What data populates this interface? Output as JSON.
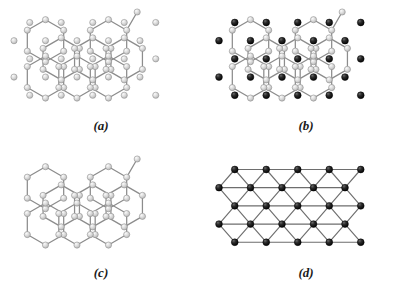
{
  "figure": {
    "type": "lattice-diagram",
    "background_color": "#ffffff",
    "panel_count": 4,
    "panels": [
      {
        "id": "a",
        "label": "(a)",
        "label_x": 101,
        "label_y": 130,
        "description": "honeycomb lattice with light spheres at vertices and at interstitial hexagon-center sites",
        "origin_x": 14,
        "origin_y": 12,
        "show_honeycomb_bonds": true,
        "show_vertex_atoms": true,
        "show_center_atoms": true,
        "center_atom_style": "light"
      },
      {
        "id": "b",
        "label": "(b)",
        "label_x": 306,
        "label_y": 130,
        "description": "honeycomb lattice with light spheres at vertices and dark spheres at interstitial hexagon-center sites",
        "origin_x": 219,
        "origin_y": 12,
        "show_honeycomb_bonds": true,
        "show_vertex_atoms": true,
        "show_center_atoms": true,
        "center_atom_style": "dark"
      },
      {
        "id": "c",
        "label": "(c)",
        "label_x": 101,
        "label_y": 277,
        "description": "honeycomb lattice alone, light spheres at vertices only",
        "origin_x": 14,
        "origin_y": 159,
        "show_honeycomb_bonds": true,
        "show_vertex_atoms": true,
        "show_center_atoms": false,
        "center_atom_style": "light"
      },
      {
        "id": "d",
        "label": "(d)",
        "label_x": 306,
        "label_y": 277,
        "description": "triangular lattice formed by the dark interstitial sublattice with bonds drawn between nearest dark sites",
        "origin_x": 219,
        "origin_y": 159,
        "show_honeycomb_bonds": false,
        "show_vertex_atoms": false,
        "show_center_atoms": true,
        "center_atom_style": "dark",
        "show_triangular_bonds": true
      }
    ],
    "geometry": {
      "bond_length": 21.0,
      "hex_rows": 3,
      "hex_cols": 3,
      "row_shift_x": 10.5,
      "comment": "honeycomb drawn from hexagon cells; interstitial sites sit at hexagon centres and at the equivalent triangular-lattice sites outside the bonded region"
    },
    "colors": {
      "background": "#ffffff",
      "bond_stroke": "#8c8c8c",
      "bond_stroke_dark": "#6e6e6e",
      "atom_light_fill": "#d8d8d8",
      "atom_light_highlight": "#f4f4f4",
      "atom_light_stroke": "#8a8a8a",
      "atom_dark_fill": "#151515",
      "atom_dark_highlight": "#5a5a5a",
      "atom_dark_stroke": "#000000",
      "label_color": "#1a1a1a"
    },
    "sizes": {
      "atom_light_radius": 3.1,
      "atom_dark_radius": 3.4,
      "bond_width": 1.25,
      "triangular_bond_width": 1.15
    }
  }
}
